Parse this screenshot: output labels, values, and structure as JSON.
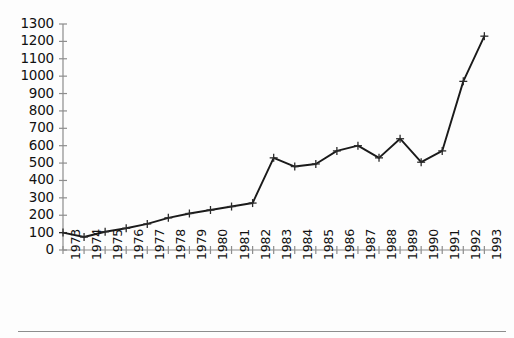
{
  "chart_data": {
    "type": "line",
    "title": "",
    "subtitle": "",
    "xlabel": "",
    "ylabel": "",
    "categories": [
      "1973",
      "1974",
      "1975",
      "1976",
      "1977",
      "1978",
      "1979",
      "1980",
      "1981",
      "1982",
      "1983",
      "1984",
      "1985",
      "1986",
      "1987",
      "1988",
      "1989",
      "1990",
      "1991",
      "1992",
      "1993"
    ],
    "values": [
      100,
      75,
      105,
      125,
      150,
      185,
      210,
      230,
      250,
      270,
      530,
      480,
      495,
      570,
      600,
      530,
      640,
      505,
      570,
      970,
      1230
    ],
    "series": [
      {
        "name": "series-1",
        "values": [
          100,
          75,
          105,
          125,
          150,
          185,
          210,
          230,
          250,
          270,
          530,
          480,
          495,
          570,
          600,
          530,
          640,
          505,
          570,
          970,
          1230
        ]
      }
    ],
    "x": [
      1973,
      1974,
      1975,
      1976,
      1977,
      1978,
      1979,
      1980,
      1981,
      1982,
      1983,
      1984,
      1985,
      1986,
      1987,
      1988,
      1989,
      1990,
      1991,
      1992,
      1993
    ],
    "ylim": [
      0,
      1300
    ],
    "xlim": [
      1973,
      1993
    ],
    "ytick_labels": [
      "0",
      "100",
      "200",
      "300",
      "400",
      "500",
      "600",
      "700",
      "800",
      "900",
      "1000",
      "1100",
      "1200",
      "1300"
    ],
    "ytick_values": [
      0,
      100,
      200,
      300,
      400,
      500,
      600,
      700,
      800,
      900,
      1000,
      1100,
      1200,
      1300
    ],
    "xtick_labels": [
      "1973",
      "1974",
      "1975",
      "1976",
      "1977",
      "1978",
      "1979",
      "1980",
      "1981",
      "1982",
      "1983",
      "1984",
      "1985",
      "1986",
      "1987",
      "1988",
      "1989",
      "1990",
      "1991",
      "1992",
      "1993"
    ],
    "grid": false,
    "legend": null,
    "legend_position": "none",
    "marker": "plus",
    "line_color": "#1a1a1a",
    "axis_color": "#8d8d8d",
    "marker_color": "#2b2b2b",
    "background_color": "#fdfdfd",
    "xtick_label_rotation": 90,
    "annotations": []
  },
  "figure": {
    "footer_rule": true
  }
}
